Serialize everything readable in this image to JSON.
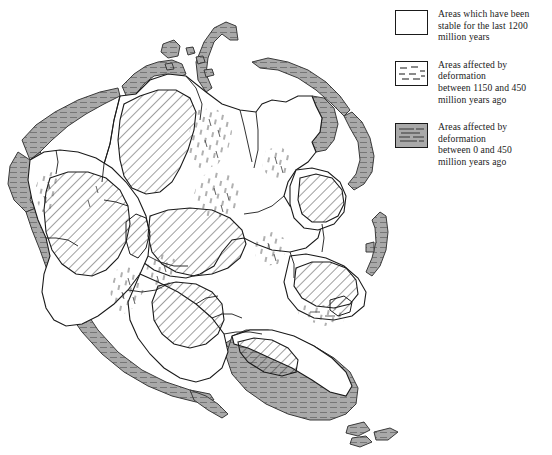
{
  "figure": {
    "kind": "paleogeographic-map"
  },
  "colors": {
    "outline": "#1a1a1a",
    "background": "#ffffff",
    "orogen_fill": "#a9a9a9",
    "orogen_line": "#5a5a5a",
    "hatch_line": "#2a2a2a",
    "dash_line": "#444444"
  },
  "legend": {
    "items": [
      {
        "swatch": "blank-white-box",
        "label": "Areas which have been\nstable for the last 1200\nmillion years",
        "period_start_ma": 1200,
        "period_end_ma": 0
      },
      {
        "swatch": "dashed-lines-box",
        "label": "Areas affected by deformation\nbetween 1150 and 450\nmillion years ago",
        "period_start_ma": 1150,
        "period_end_ma": 450
      },
      {
        "swatch": "gray-striated-box",
        "label": "Areas affected by deformation\nbetween 0 and 450\nmillion years ago",
        "period_start_ma": 450,
        "period_end_ma": 0
      }
    ]
  },
  "map_regions": {
    "stable_cratons": "white unpatterned interiors",
    "mid_proterozoic_belts": "diagonal-hatched and short-dash stippled zones",
    "phanerozoic_orogens": "gray fills with horizontal striations along continental margins"
  }
}
